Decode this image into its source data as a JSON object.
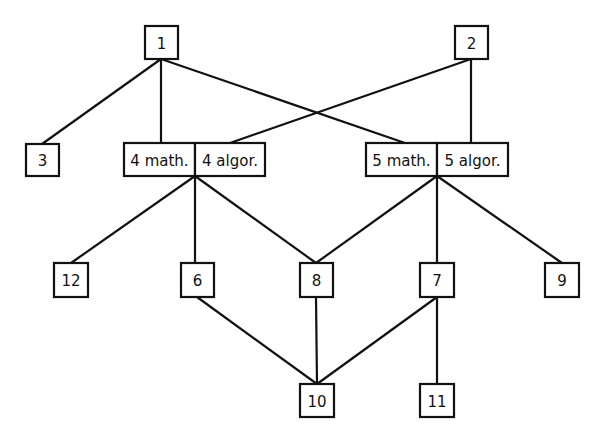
{
  "diagram": {
    "type": "directed-graph",
    "nodes": [
      {
        "id": "1",
        "label": "1",
        "x": 145,
        "y": 26,
        "w": 33,
        "h": 33
      },
      {
        "id": "2",
        "label": "2",
        "x": 455,
        "y": 26,
        "w": 33,
        "h": 33
      },
      {
        "id": "3",
        "label": "3",
        "x": 26,
        "y": 144,
        "w": 33,
        "h": 32
      },
      {
        "id": "4math",
        "label": "4 math.",
        "x": 124,
        "y": 143,
        "w": 71,
        "h": 33
      },
      {
        "id": "4algor",
        "label": "4 algor.",
        "x": 195,
        "y": 143,
        "w": 70,
        "h": 33
      },
      {
        "id": "5math",
        "label": "5 math.",
        "x": 366,
        "y": 143,
        "w": 71,
        "h": 33
      },
      {
        "id": "5algor",
        "label": "5 algor.",
        "x": 437,
        "y": 143,
        "w": 71,
        "h": 33
      },
      {
        "id": "12",
        "label": "12",
        "x": 54,
        "y": 263,
        "w": 34,
        "h": 34
      },
      {
        "id": "6",
        "label": "6",
        "x": 181,
        "y": 263,
        "w": 33,
        "h": 34
      },
      {
        "id": "8",
        "label": "8",
        "x": 300,
        "y": 263,
        "w": 33,
        "h": 34
      },
      {
        "id": "7",
        "label": "7",
        "x": 420,
        "y": 263,
        "w": 34,
        "h": 34
      },
      {
        "id": "9",
        "label": "9",
        "x": 545,
        "y": 263,
        "w": 34,
        "h": 34
      },
      {
        "id": "10",
        "label": "10",
        "x": 300,
        "y": 384,
        "w": 34,
        "h": 33
      },
      {
        "id": "11",
        "label": "11",
        "x": 420,
        "y": 384,
        "w": 34,
        "h": 33
      }
    ],
    "edges": [
      {
        "from": "1",
        "to": "3",
        "x1": 161,
        "y1": 59,
        "x2": 42,
        "y2": 144
      },
      {
        "from": "1",
        "to": "4math",
        "x1": 161,
        "y1": 59,
        "x2": 161,
        "y2": 143
      },
      {
        "from": "1",
        "to": "5math",
        "x1": 161,
        "y1": 59,
        "x2": 405,
        "y2": 143
      },
      {
        "from": "2",
        "to": "4algor",
        "x1": 471,
        "y1": 59,
        "x2": 230,
        "y2": 143
      },
      {
        "from": "2",
        "to": "5algor",
        "x1": 471,
        "y1": 59,
        "x2": 471,
        "y2": 143
      },
      {
        "from": "4",
        "to": "12",
        "x1": 195,
        "y1": 176,
        "x2": 71,
        "y2": 263
      },
      {
        "from": "4",
        "to": "6",
        "x1": 195,
        "y1": 176,
        "x2": 195,
        "y2": 263
      },
      {
        "from": "4",
        "to": "8",
        "x1": 195,
        "y1": 176,
        "x2": 316,
        "y2": 263
      },
      {
        "from": "5",
        "to": "8",
        "x1": 437,
        "y1": 176,
        "x2": 316,
        "y2": 263
      },
      {
        "from": "5",
        "to": "7",
        "x1": 437,
        "y1": 176,
        "x2": 437,
        "y2": 263
      },
      {
        "from": "5",
        "to": "9",
        "x1": 437,
        "y1": 176,
        "x2": 562,
        "y2": 263
      },
      {
        "from": "6",
        "to": "10",
        "x1": 197,
        "y1": 297,
        "x2": 317,
        "y2": 384
      },
      {
        "from": "8",
        "to": "10",
        "x1": 316,
        "y1": 297,
        "x2": 317,
        "y2": 384
      },
      {
        "from": "7",
        "to": "10",
        "x1": 437,
        "y1": 297,
        "x2": 317,
        "y2": 384
      },
      {
        "from": "7",
        "to": "11",
        "x1": 437,
        "y1": 297,
        "x2": 437,
        "y2": 384
      }
    ]
  }
}
